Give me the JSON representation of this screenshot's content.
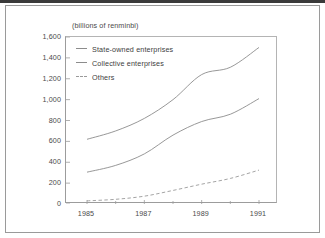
{
  "figure": {
    "unit_label": "(billions of renminbi)"
  },
  "chart_data": {
    "type": "line",
    "title": "",
    "subtitle": "",
    "xlabel": "",
    "ylabel": "(billions of renminbi)",
    "xlim": [
      1985,
      1991
    ],
    "ylim": [
      0,
      1600
    ],
    "grid": false,
    "legend_position": "top-left-inside",
    "x": [
      1985,
      1986,
      1987,
      1988,
      1989,
      1990,
      1991
    ],
    "xtick_labels": [
      "1985",
      "1987",
      "1989",
      "1991"
    ],
    "xtick_values": [
      1985,
      1987,
      1989,
      1991
    ],
    "xminor_values": [
      1986,
      1988,
      1990
    ],
    "ytick_labels": [
      "0",
      "200",
      "400",
      "600",
      "800",
      "1,000",
      "1,200",
      "1,400",
      "1,600"
    ],
    "ytick_values": [
      0,
      200,
      400,
      600,
      800,
      1000,
      1200,
      1400,
      1600
    ],
    "series": [
      {
        "name": "State-owned enterprises",
        "style": "solid",
        "color": "#8c8c8c",
        "values": [
          620,
          700,
          820,
          1000,
          1240,
          1310,
          1500
        ]
      },
      {
        "name": "Collective enterprises",
        "style": "solid",
        "color": "#8c8c8c",
        "values": [
          305,
          370,
          480,
          660,
          790,
          860,
          1010
        ]
      },
      {
        "name": "Others",
        "style": "dashed",
        "color": "#9a9a9a",
        "values": [
          30,
          45,
          75,
          130,
          190,
          245,
          325
        ]
      }
    ]
  }
}
